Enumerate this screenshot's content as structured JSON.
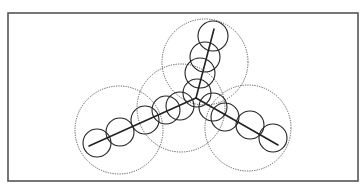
{
  "figure": {
    "type": "diagram",
    "frame": {
      "x": 8,
      "y": 13,
      "width": 350,
      "height": 168,
      "stroke": "#555555",
      "stroke_width": 1.6
    },
    "colors": {
      "line": "#222222",
      "small_circle": "#222222",
      "large_circle": "#444444",
      "background": "#ffffff"
    },
    "junction": {
      "x": 196,
      "y": 98
    },
    "skeleton_lines": [
      {
        "name": "top-arm",
        "x1": 214,
        "y1": 29,
        "x2": 196,
        "y2": 98
      },
      {
        "name": "left-arm",
        "x1": 89,
        "y1": 146,
        "x2": 196,
        "y2": 98
      },
      {
        "name": "right-arm",
        "x1": 196,
        "y1": 98,
        "x2": 278,
        "y2": 145
      }
    ],
    "large_dotted_circles": [
      {
        "name": "top",
        "cx": 205,
        "cy": 62,
        "r": 43
      },
      {
        "name": "center",
        "cx": 181,
        "cy": 108,
        "r": 44
      },
      {
        "name": "left",
        "cx": 119,
        "cy": 130,
        "r": 44
      },
      {
        "name": "right",
        "cx": 248,
        "cy": 128,
        "r": 43
      }
    ],
    "small_solid_circles": [
      {
        "cx": 213,
        "cy": 36,
        "r": 15
      },
      {
        "cx": 205,
        "cy": 57,
        "r": 15
      },
      {
        "cx": 200,
        "cy": 73,
        "r": 15
      },
      {
        "cx": 197,
        "cy": 93,
        "r": 14
      },
      {
        "cx": 97,
        "cy": 143,
        "r": 14
      },
      {
        "cx": 120,
        "cy": 132,
        "r": 14
      },
      {
        "cx": 145,
        "cy": 120,
        "r": 14
      },
      {
        "cx": 166,
        "cy": 110,
        "r": 14
      },
      {
        "cx": 180,
        "cy": 106,
        "r": 14
      },
      {
        "cx": 213,
        "cy": 107,
        "r": 14
      },
      {
        "cx": 225,
        "cy": 117,
        "r": 14
      },
      {
        "cx": 250,
        "cy": 125,
        "r": 14
      },
      {
        "cx": 273,
        "cy": 138,
        "r": 14
      }
    ]
  }
}
